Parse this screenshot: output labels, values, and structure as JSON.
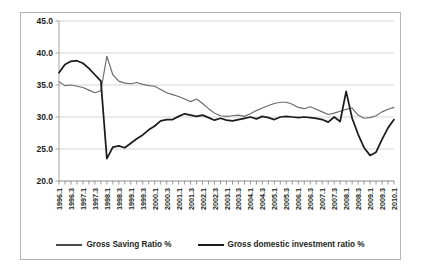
{
  "chart_data": {
    "type": "line",
    "title": "",
    "subtitle": "",
    "xlabel": "",
    "ylabel": "",
    "ylim": [
      20.0,
      45.0
    ],
    "ytick_step": 5.0,
    "ytick_labels": [
      "45.0",
      "40.0",
      "35.0",
      "30.0",
      "25.0",
      "20.0"
    ],
    "ytick_values": [
      45.0,
      40.0,
      35.0,
      30.0,
      25.0,
      20.0
    ],
    "grid": true,
    "grid_axis": "y",
    "legend_position": "bottom",
    "x": [
      "1996.1",
      "1996.2",
      "1996.3",
      "1996.4",
      "1997.1",
      "1997.2",
      "1997.3",
      "1997.4",
      "1998.1",
      "1998.2",
      "1998.3",
      "1998.4",
      "1999.1",
      "1999.2",
      "1999.3",
      "1999.4",
      "2000.1",
      "2000.2",
      "2000.3",
      "2000.4",
      "2001.1",
      "2001.2",
      "2001.3",
      "2001.4",
      "2002.1",
      "2002.2",
      "2002.3",
      "2002.4",
      "2003.1",
      "2003.2",
      "2003.3",
      "2003.4",
      "2004.1",
      "2004.2",
      "2004.3",
      "2004.4",
      "2005.1",
      "2005.2",
      "2005.3",
      "2005.4",
      "2006.1",
      "2006.2",
      "2006.3",
      "2006.4",
      "2007.1",
      "2007.2",
      "2007.3",
      "2007.4",
      "2008.1",
      "2008.2",
      "2008.3",
      "2008.4",
      "2009.1",
      "2009.2",
      "2009.3",
      "2009.4",
      "2010.1"
    ],
    "xtick_labels": [
      "1996.1",
      "1996.3",
      "1997.1",
      "1997.3",
      "1998.1",
      "1998.3",
      "1999.1",
      "1999.3",
      "2000.1",
      "2000.3",
      "2001.1",
      "2001.3",
      "2002.1",
      "2002.3",
      "2003.1",
      "2003.3",
      "2004.1",
      "2004.3",
      "2005.1",
      "2005.3",
      "2006.1",
      "2006.3",
      "2007.1",
      "2007.3",
      "2008.1",
      "2008.3",
      "2009.1",
      "2009.3",
      "2010.1"
    ],
    "xtick_every": 2,
    "series": [
      {
        "name": "Gross Saving Ratio %",
        "color": "#6b6b6b",
        "width": 1.15,
        "values": [
          35.5,
          34.9,
          35.0,
          34.8,
          34.6,
          34.2,
          33.8,
          34.1,
          39.5,
          36.6,
          35.6,
          35.3,
          35.2,
          35.4,
          35.1,
          34.9,
          34.8,
          34.3,
          33.8,
          33.5,
          33.2,
          32.8,
          32.4,
          32.8,
          32.1,
          31.3,
          30.6,
          30.2,
          30.1,
          30.2,
          30.3,
          30.1,
          30.5,
          31.0,
          31.4,
          31.8,
          32.1,
          32.3,
          32.3,
          32.0,
          31.5,
          31.3,
          31.6,
          31.2,
          30.8,
          30.4,
          30.6,
          30.9,
          31.2,
          31.4,
          30.3,
          29.8,
          29.9,
          30.2,
          30.8,
          31.2,
          31.5
        ]
      },
      {
        "name": "Gross domestic investment ratio %",
        "color": "#1c1c1c",
        "width": 1.75,
        "values": [
          36.9,
          38.2,
          38.7,
          38.8,
          38.4,
          37.6,
          36.6,
          35.6,
          23.5,
          25.3,
          25.5,
          25.2,
          25.9,
          26.6,
          27.2,
          28.0,
          28.6,
          29.4,
          29.6,
          29.6,
          30.1,
          30.5,
          30.3,
          30.1,
          30.3,
          29.9,
          29.5,
          29.8,
          29.5,
          29.4,
          29.6,
          29.8,
          30.0,
          29.7,
          30.1,
          29.9,
          29.6,
          30.0,
          30.1,
          30.0,
          29.9,
          30.0,
          29.9,
          29.8,
          29.6,
          29.2,
          30.0,
          29.3,
          34.0,
          29.8,
          27.3,
          25.2,
          24.0,
          24.5,
          26.5,
          28.3,
          29.6
        ]
      }
    ]
  },
  "legend": {
    "items": [
      {
        "label": "Gross Saving Ratio %"
      },
      {
        "label": "Gross domestic investment ratio %"
      }
    ]
  }
}
